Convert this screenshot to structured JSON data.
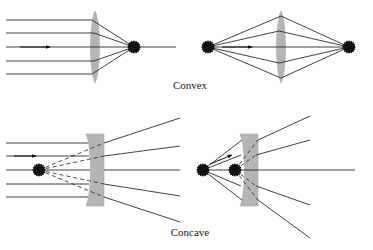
{
  "figure": {
    "title": "",
    "background_color": "#ffffff",
    "ray_color": "#2b2b2b",
    "lens_fill_color": "#b5b5b5",
    "marker_color": "#111111",
    "width": 373,
    "height": 250
  },
  "captions": {
    "convex": "Convex",
    "concave": "Concave"
  },
  "panels": [
    {
      "id": "convex-parallel-rays",
      "label": "Convex lens, parallel incoming rays converge to focal point",
      "lens_type": "convex",
      "lens_center_x": 95,
      "lens_center_y": 47,
      "lens_half_height": 36,
      "lens_max_half_width": 7,
      "optical_axis_y": 47,
      "axis_start_x": 6,
      "axis_end_x": 176,
      "focal_point": {
        "x": 134,
        "y": 47,
        "kind": "real-image"
      },
      "incoming_ray_ys": [
        20,
        33,
        47,
        61,
        74
      ],
      "incoming_ray_start_x": 6,
      "arrow_on_ray_index": 2,
      "arrow_x": 47,
      "object_points": [],
      "virtual_rays": false
    },
    {
      "id": "convex-point-source",
      "label": "Convex lens, point source imaged to point image",
      "lens_type": "convex",
      "lens_center_x": 281,
      "lens_center_y": 47,
      "lens_half_height": 36,
      "lens_max_half_width": 7,
      "optical_axis_y": 47,
      "axis_start_x": 208,
      "axis_end_x": 349,
      "focal_point": {
        "x": 349,
        "y": 47,
        "kind": "real-image"
      },
      "incoming_ray_ys": [],
      "incoming_ray_start_x": 208,
      "arrow_on_ray_index": 2,
      "arrow_x": 246,
      "object_points": [
        {
          "x": 208,
          "y": 47,
          "kind": "source"
        }
      ],
      "lens_hit_ys": [
        16,
        31,
        47,
        63,
        78
      ],
      "virtual_rays": false
    },
    {
      "id": "concave-parallel-rays",
      "label": "Concave lens, parallel rays diverge from virtual focal point",
      "lens_type": "concave",
      "lens_center_x": 95,
      "lens_center_y": 170,
      "lens_half_height": 36,
      "lens_min_half_width": 4,
      "lens_max_half_width": 9,
      "optical_axis_y": 170,
      "axis_start_x": 6,
      "axis_end_x": 180,
      "focal_point": {
        "x": 39,
        "y": 170,
        "kind": "virtual-focus"
      },
      "incoming_ray_ys": [
        143,
        156,
        170,
        184,
        197
      ],
      "incoming_ray_start_x": 6,
      "arrow_on_ray_index": 2,
      "arrow_x": 30,
      "outgoing_end_x": 180,
      "outgoing_end_ys": [
        118,
        146,
        170,
        196,
        222
      ],
      "object_points": [],
      "virtual_rays": true
    },
    {
      "id": "concave-point-source",
      "label": "Concave lens, point source forms closer virtual image",
      "lens_type": "concave",
      "lens_center_x": 249,
      "lens_center_y": 170,
      "lens_half_height": 36,
      "lens_min_half_width": 4,
      "lens_max_half_width": 9,
      "optical_axis_y": 170,
      "axis_start_x": 203,
      "axis_end_x": 355,
      "focal_point": {
        "x": 235,
        "y": 170,
        "kind": "virtual-image"
      },
      "incoming_ray_ys": [],
      "incoming_ray_start_x": 203,
      "arrow_on_ray_index": 0,
      "arrow_x": 222,
      "lens_hit_ys": [
        140,
        155,
        170,
        186,
        200
      ],
      "outgoing_end_x": 310,
      "outgoing_end_ys": [
        116,
        140,
        170,
        205,
        238
      ],
      "object_points": [
        {
          "x": 203,
          "y": 170,
          "kind": "source"
        },
        {
          "x": 235,
          "y": 170,
          "kind": "virtual-image"
        }
      ],
      "virtual_rays": true
    }
  ]
}
